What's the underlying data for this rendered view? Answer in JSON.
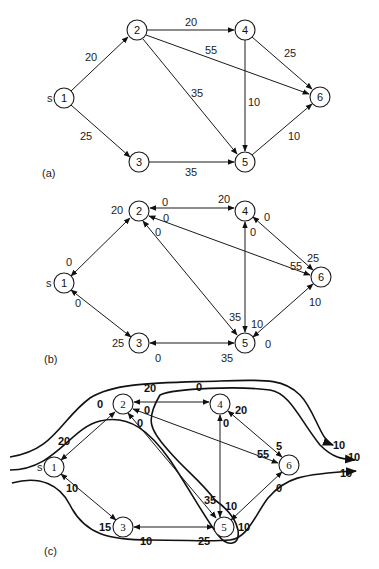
{
  "panels": {
    "a": {
      "label": "(a)",
      "source_marker": "s",
      "nodes": [
        {
          "id": "1",
          "x": 64,
          "y": 98
        },
        {
          "id": "2",
          "x": 137,
          "y": 30
        },
        {
          "id": "3",
          "x": 139,
          "y": 162
        },
        {
          "id": "4",
          "x": 245,
          "y": 30
        },
        {
          "id": "5",
          "x": 245,
          "y": 162
        },
        {
          "id": "6",
          "x": 320,
          "y": 97
        }
      ],
      "edges": [
        {
          "from": "1",
          "to": "2",
          "capacity": "20"
        },
        {
          "from": "1",
          "to": "3",
          "capacity": "25"
        },
        {
          "from": "2",
          "to": "4",
          "capacity": "20"
        },
        {
          "from": "2",
          "to": "6",
          "capacity": "55"
        },
        {
          "from": "2",
          "to": "5",
          "capacity": "35"
        },
        {
          "from": "4",
          "to": "5",
          "capacity": "10"
        },
        {
          "from": "4",
          "to": "6",
          "capacity": "25"
        },
        {
          "from": "3",
          "to": "5",
          "capacity": "35"
        },
        {
          "from": "5",
          "to": "6",
          "capacity": "10"
        }
      ],
      "edge_labels": {
        "e12": "20",
        "e13": "25",
        "e24": "20",
        "e26": "55",
        "e25": "35",
        "e45": "10",
        "e46": "25",
        "e35": "35",
        "e56": "10"
      }
    },
    "b": {
      "label": "(b)",
      "source_marker": "s",
      "nodes": [
        {
          "id": "1",
          "x": 64,
          "y": 283
        },
        {
          "id": "2",
          "x": 139,
          "y": 211
        },
        {
          "id": "3",
          "x": 139,
          "y": 343
        },
        {
          "id": "4",
          "x": 245,
          "y": 211
        },
        {
          "id": "5",
          "x": 245,
          "y": 343
        },
        {
          "id": "6",
          "x": 321,
          "y": 277
        }
      ],
      "residual_labels": {
        "r12_at2": "20",
        "r12_at1": "0",
        "r13_at1": "0",
        "r13_at3": "25",
        "r24_at2": "0",
        "r24_at4": "20",
        "r26_at2": "0",
        "r26_at6": "55",
        "r25_at2": "0",
        "r25_at5": "35",
        "r45_at4": "0",
        "r45_at5": "10",
        "r46_at4": "0",
        "r46_at6": "25",
        "r35_at3": "0",
        "r35_at5": "35",
        "r56_at6": "10",
        "r56_at5": "0"
      }
    },
    "c": {
      "label": "(c)",
      "source_marker": "s",
      "nodes": [
        {
          "id": "1",
          "x": 54,
          "y": 467
        },
        {
          "id": "2",
          "x": 123,
          "y": 404
        },
        {
          "id": "3",
          "x": 123,
          "y": 527
        },
        {
          "id": "4",
          "x": 220,
          "y": 404
        },
        {
          "id": "5",
          "x": 224,
          "y": 527
        },
        {
          "id": "6",
          "x": 289,
          "y": 465
        }
      ],
      "residual_labels": {
        "r12_at2": "0",
        "r12_at1": "20",
        "r13_at1": "10",
        "r13_at3": "15",
        "r24_at2": "20",
        "r24_at4": "0",
        "r26_at2": "0",
        "r26_at6": "55",
        "r25_at2": "0",
        "r25_at5": "35",
        "r45_at4": "0",
        "r45_at5": "10",
        "r46_at4": "20",
        "r46_at6": "5",
        "r35_at3": "10",
        "r35_at5": "25",
        "r56_at6": "0",
        "r56_at5": "10"
      },
      "flow_paths": [
        {
          "path": "1-2-4-6",
          "amount": "10"
        },
        {
          "path": "1-2-5-6",
          "amount": "10"
        },
        {
          "path": "1-3-5-6",
          "amount": "10"
        }
      ],
      "flow_outputs": [
        "10",
        "10",
        "10"
      ]
    }
  }
}
